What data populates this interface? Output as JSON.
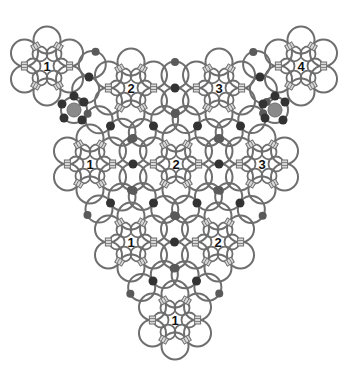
{
  "diagram": {
    "type": "chainmail-ring-pattern",
    "colors": {
      "background": "#ffffff",
      "ring_stroke": "#6e6e6e",
      "ring_fill": "#ffffff",
      "link_fill": "#d8d8d8",
      "joint_dark": "#333333",
      "joint_mid": "#5a5a5a",
      "big_joint": "#8a8a8a"
    },
    "clusters": [
      {
        "id": "top-1",
        "label": "1",
        "cx": 47,
        "cy": 66
      },
      {
        "id": "top-2",
        "label": "2",
        "cx": 131,
        "cy": 88
      },
      {
        "id": "top-3",
        "label": "3",
        "cx": 219,
        "cy": 88
      },
      {
        "id": "top-4",
        "label": "4",
        "cx": 301,
        "cy": 66
      },
      {
        "id": "mid-1",
        "label": "1",
        "cx": 90,
        "cy": 164
      },
      {
        "id": "mid-2",
        "label": "2",
        "cx": 176,
        "cy": 164
      },
      {
        "id": "mid-3",
        "label": "3",
        "cx": 262,
        "cy": 164
      },
      {
        "id": "low-1",
        "label": "1",
        "cx": 131,
        "cy": 242
      },
      {
        "id": "low-2",
        "label": "2",
        "cx": 218,
        "cy": 242
      },
      {
        "id": "bottom-1",
        "label": "1",
        "cx": 175,
        "cy": 320
      }
    ],
    "big_joints": [
      {
        "cx": 74,
        "cy": 110
      },
      {
        "cx": 275,
        "cy": 110
      }
    ]
  }
}
